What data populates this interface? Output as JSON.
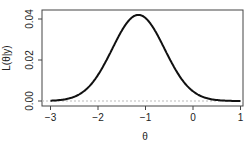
{
  "chart_data": {
    "type": "line",
    "title": "",
    "xlabel": "θ",
    "ylabel": "L(θ|y)",
    "xlim": [
      -3.1,
      1.05
    ],
    "ylim": [
      -0.002,
      0.044
    ],
    "x_ticks": [
      -3,
      -2,
      -1,
      0,
      1
    ],
    "x_tick_labels": [
      "−3",
      "−2",
      "−1",
      "0",
      "1"
    ],
    "y_ticks": [
      0.0,
      0.02,
      0.04
    ],
    "y_tick_labels": [
      "0.00",
      "0.02",
      "0.04"
    ],
    "grid": false,
    "reference_line": {
      "y": 0,
      "style": "dashed",
      "color": "#bbbbbb"
    },
    "series": [
      {
        "name": "likelihood",
        "color": "#111111",
        "shape": "gaussian",
        "peak_x": -1.15,
        "peak_y": 0.042,
        "sd": 0.55,
        "x": [
          -3.0,
          -2.75,
          -2.5,
          -2.25,
          -2.0,
          -1.75,
          -1.5,
          -1.25,
          -1.15,
          -1.0,
          -0.75,
          -0.5,
          -0.25,
          0.0,
          0.25,
          0.5,
          0.75,
          1.0
        ],
        "y": [
          0.0006,
          0.0015,
          0.0037,
          0.0078,
          0.0127,
          0.0231,
          0.0343,
          0.0413,
          0.042,
          0.0405,
          0.032,
          0.0206,
          0.0107,
          0.0047,
          0.0018,
          0.0006,
          0.0002,
          0.0001
        ]
      }
    ]
  }
}
